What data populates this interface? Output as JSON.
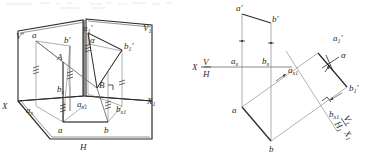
{
  "figure": {
    "stroke_color": "#2b2b2b",
    "thin_color": "#7a7a7a",
    "background": "#ffffff"
  },
  "left_diagram": {
    "name": "pictorial-3d-projection-planes",
    "labels": {
      "v_plane": "V",
      "v_plane_prime": "′",
      "v1_plane": "V",
      "v1_plane_sub": "1",
      "h_plane": "H",
      "x_axis": "X",
      "x1_axis": "X",
      "x1_axis_sub": "1",
      "a_front": "a",
      "a_front_prime": "′",
      "b_front": "b",
      "b_front_prime": "′",
      "a1_front": "a",
      "a1_front_sub": "1",
      "a1_front_prime": "′",
      "b1_front": "b",
      "b1_front_sub": "1",
      "b1_front_prime": "′",
      "point_A": "A",
      "point_B": "B",
      "a_horiz": "a",
      "b_horiz": "b",
      "a_x": "a",
      "a_x_sub": "x",
      "b_x": "b",
      "b_x_sub": "x",
      "a_x1": "a",
      "a_x1_sub": "x1",
      "b_x1": "b",
      "b_x1_sub": "x1",
      "angle_alpha": "α"
    }
  },
  "right_diagram": {
    "name": "orthographic-auxiliary-projection",
    "labels": {
      "x_axis": "X",
      "vh_divider_top": "V",
      "vh_divider_bottom": "H",
      "a_front": "a",
      "a_front_prime": "′",
      "b_front": "b",
      "b_front_prime": "′",
      "a_horiz": "a",
      "b_horiz": "b",
      "a_x": "a",
      "a_x_sub": "x",
      "b_x": "b",
      "b_x_sub": "x",
      "a_x1": "a",
      "a_x1_sub": "x1",
      "b_x1": "b",
      "b_x1_sub": "x1",
      "a1_front": "a",
      "a1_front_sub": "1",
      "a1_front_prime": "′",
      "b1_front": "b",
      "b1_front_sub": "1",
      "b1_front_prime": "′",
      "angle_alpha": "α",
      "v1h1_top": "V",
      "v1h1_top_sub": "1",
      "v1h1_bottom": "H",
      "v1h1_bottom_sub": "1",
      "x1_axis": "X",
      "x1_axis_sub": "1"
    }
  }
}
